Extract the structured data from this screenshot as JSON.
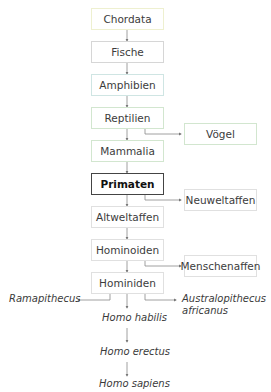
{
  "diagram": {
    "main_chain": [
      {
        "label": "Chordata",
        "border": "#eef0d0"
      },
      {
        "label": "Fische",
        "border": "#d6d6d6"
      },
      {
        "label": "Amphibien",
        "border": "#cfe5e3"
      },
      {
        "label": "Reptilien",
        "border": "#d2e6cf"
      },
      {
        "label": "Mammalia",
        "border": "#d2e6cf"
      },
      {
        "label": "Primaten",
        "border": "#444444",
        "bold": true
      },
      {
        "label": "Altweltaffen",
        "border": "#e0e0e0"
      },
      {
        "label": "Hominoiden",
        "border": "#e0e0e0"
      },
      {
        "label": "Hominiden",
        "border": "#e0e0e0"
      }
    ],
    "branches": [
      {
        "from": "Reptilien",
        "label": "Vögel"
      },
      {
        "from": "Primaten",
        "label": "Neuweltaffen"
      },
      {
        "from": "Hominoiden",
        "label": "Menschenaffen"
      }
    ],
    "hominid_branches": {
      "left": "Ramapithecus",
      "right_line1": "Australopithecus",
      "right_line2": "africanus"
    },
    "homo_chain": [
      "Homo habilis",
      "Homo erectus",
      "Homo sapiens"
    ]
  }
}
